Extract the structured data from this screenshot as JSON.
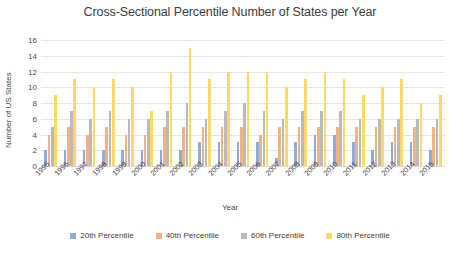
{
  "chart_data": {
    "type": "bar",
    "title": "Cross-Sectional Percentile Number of States per Year",
    "xlabel": "Year",
    "ylabel": "Number of US States",
    "ylim": [
      0,
      16
    ],
    "yticks": [
      0,
      2,
      4,
      6,
      8,
      10,
      12,
      14,
      16
    ],
    "grid": true,
    "legend_position": "bottom",
    "categories": [
      "1995",
      "1996",
      "1997",
      "1998",
      "1999",
      "2000",
      "2001",
      "2002",
      "2003",
      "2004",
      "2005",
      "2006",
      "2007",
      "2008",
      "2009",
      "2010",
      "2011",
      "2012",
      "2013",
      "2014",
      "2015"
    ],
    "series": [
      {
        "name": "20th Percentile",
        "color": "#8faadc",
        "values": [
          2,
          2,
          2,
          2,
          2,
          2,
          2,
          2,
          3,
          3,
          3,
          3,
          1,
          3,
          4,
          4,
          3,
          2,
          3,
          3,
          2
        ]
      },
      {
        "name": "40th Percentile",
        "color": "#f4b183",
        "values": [
          4,
          5,
          4,
          5,
          4,
          4,
          5,
          5,
          5,
          5,
          5,
          4,
          5,
          5,
          5,
          5,
          5,
          5,
          5,
          5,
          5
        ]
      },
      {
        "name": "60th Percentile",
        "color": "#b9babb",
        "values": [
          5,
          7,
          6,
          7,
          6,
          6,
          7,
          8,
          6,
          7,
          8,
          7,
          6,
          7,
          7,
          7,
          6,
          6,
          6,
          6,
          6
        ]
      },
      {
        "name": "80th Percentile",
        "color": "#ffd966",
        "values": [
          9,
          11,
          10,
          11,
          10,
          7,
          12,
          15,
          11,
          12,
          12,
          12,
          10,
          11,
          12,
          11,
          9,
          10,
          11,
          8,
          9
        ]
      }
    ]
  },
  "legend": {
    "items": [
      {
        "label": "20th Percentile"
      },
      {
        "label": "40th Percentile"
      },
      {
        "label": "60th Percentile"
      },
      {
        "label": "80th Percentile"
      }
    ]
  }
}
